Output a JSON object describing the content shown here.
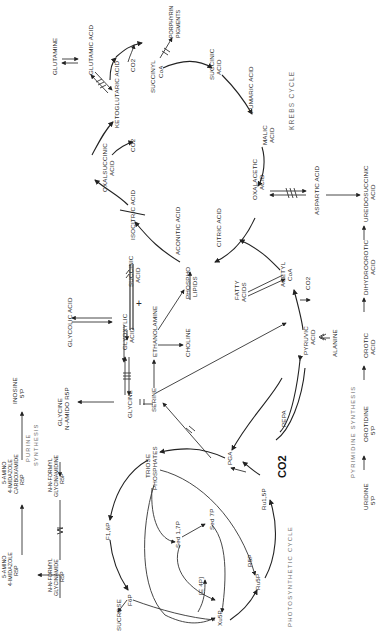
{
  "diagram": {
    "orientation": "rotated 90 degrees counter-clockwise; labels read bottom-to-top",
    "sections": {
      "krebs_title": "KREBS  CYCLE",
      "photo_title": "PHOTOSYNTHETIC  CYCLE",
      "purine_title": [
        "PURINE",
        "SYNTHESIS"
      ],
      "pyrimidine_title": "PYRIMIDINE  SYNTHESIS"
    },
    "krebs": {
      "glutamine": "GLUTAMINE",
      "glutamic": "GLUTAMIC  ACID",
      "ketoglutaric": "KETOGLUTARIC  ACID",
      "co2_a": "CO2",
      "succinyl": [
        "SUCCINYL",
        "CoA"
      ],
      "porphyrin": [
        "PORPHYRIN",
        "PIGMENTS"
      ],
      "succinic": [
        "SUCCINIC",
        "ACID"
      ],
      "fumaric": "FUMARIC  ACID",
      "malic": [
        "MALIC",
        "ACID"
      ],
      "oxalacetic": [
        "OXALACETIC",
        "ACID"
      ],
      "aspartic": "ASPARTIC  ACID",
      "ureidosuccinic": [
        "UREIDOSUCCINIC",
        "ACID"
      ],
      "oxalsuccinic": [
        "OXALSUCCINIC",
        "ACID"
      ],
      "co2_b": "CO2",
      "isocitric": "ISOCITRIC  ACID",
      "aconitic": "ACONITIC  ACID",
      "citric": "CITRIC  ACID",
      "acetyl": [
        "ACETYL",
        "CoA"
      ],
      "co2_c": "CO2",
      "fatty": [
        "FATTY",
        "ACIDS"
      ],
      "pyruvic": [
        "PYRUVIC",
        "ACID"
      ],
      "alanine": "ALANINE"
    },
    "glyoxylate": {
      "succinic2": [
        "SUCCINIC",
        "ACID"
      ],
      "plus": "+",
      "glycolic": "GLYCOLIC  ACID",
      "glyoxylic": [
        "GLYOXYLIC",
        "ACID"
      ],
      "ethanolamine": "ETHANOLAMINE",
      "phospholipids": [
        "PHOSPHO",
        "LIPIDS"
      ],
      "choline": "CHOLINE",
      "glycine": "GLYCINE",
      "serine": "SERINE",
      "glycine_amido": [
        "GLYCINE",
        "N-AMIDO  R5P"
      ]
    },
    "purine": {
      "amino_imid_r5p": [
        "5-AMINO",
        "4-IMIDAZOLE",
        "R5P"
      ],
      "amino_imid_carbox": [
        "5-AMINO",
        "4-IMIDAZOLE",
        "CARBOXAMIDE",
        "R5P"
      ],
      "inosine": [
        "INOSINE",
        "5'P"
      ],
      "formyl_glycinamidine": [
        "N-N-FORMYL",
        "GLYCINAMIDINE",
        "R5P"
      ],
      "formyl_glycinamide": [
        "N-N-FORMYL",
        "GLYCINAMIDE",
        "R5P"
      ]
    },
    "pyrimidine": {
      "dihydroorotic": [
        "DIHYDROOROTIC",
        "ACID"
      ],
      "orotic": [
        "OROTIC",
        "ACID"
      ],
      "orotidine": [
        "OROTIDINE",
        "5'P"
      ],
      "uridine": [
        "URIDINE",
        "5'P"
      ]
    },
    "photosynthetic": {
      "pepa": "PEPA",
      "pga": "PGA",
      "co2_big": "CO2",
      "triose": [
        "TRIOSE",
        "PHOSPHATES"
      ],
      "sed17p": "Sed 1,7P",
      "sed7p": "Sed 7P",
      "fl6p": "F1,6P",
      "f6p": "F6P",
      "sucrose": "SUCROSE",
      "e4p": "[E 4P]",
      "xu5p": "Xu5P",
      "r5p": "R5P",
      "ru5p": "Ru5P",
      "ru15p": "Ru1,5P"
    }
  }
}
